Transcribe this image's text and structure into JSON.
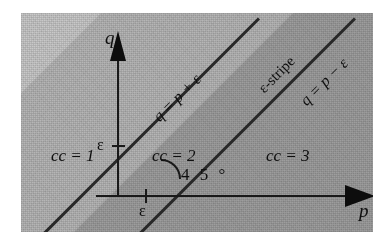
{
  "figure": {
    "type": "epsilon-stripe-diagram",
    "axes": {
      "x_label": "p",
      "y_label": "q",
      "x_tick_label": "ε",
      "y_tick_label": "ε",
      "angle_label": "4 5 °"
    },
    "lines": [
      {
        "name": "upper-boundary",
        "label": "q = p + ε",
        "slope": 1,
        "intercept": "+ε"
      },
      {
        "name": "lower-boundary",
        "label": "q = p − ε",
        "slope": 1,
        "intercept": "−ε"
      }
    ],
    "stripe_label": "ε-stripe",
    "regions": [
      {
        "name": "region-cc1",
        "label": "cc = 1",
        "shade": "#c6c6c6"
      },
      {
        "name": "region-cc2",
        "label": "cc = 2",
        "shade": "#b4b4b4"
      },
      {
        "name": "region-cc3",
        "label": "cc = 3",
        "shade": "#9d9d9d"
      }
    ],
    "colors": {
      "ink": "#131313",
      "axis": "#1d1d1d",
      "line": "#2b2b2b",
      "plate_background": "#c9c9c9",
      "page_background": "#ffffff"
    }
  }
}
